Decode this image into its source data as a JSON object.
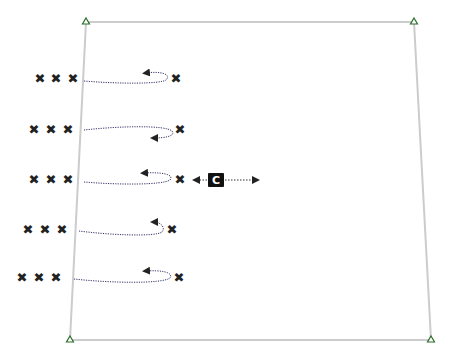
{
  "diagram": {
    "type": "drill-diagram",
    "background": "#ffffff",
    "field": {
      "border_color": "#cccccc",
      "corners": [
        {
          "name": "top-left",
          "x": 86,
          "y": 22
        },
        {
          "name": "top-right",
          "x": 414,
          "y": 22
        },
        {
          "name": "bottom-right",
          "x": 431,
          "y": 340
        },
        {
          "name": "bottom-left",
          "x": 70,
          "y": 340
        }
      ],
      "corner_marker": "cone-triangle",
      "corner_marker_color": "#2a6e2a"
    },
    "player_glyph": "✖",
    "player_color": "#222222",
    "path_color": "#333366",
    "rows": [
      {
        "queue": [
          {
            "x": 40,
            "y": 78
          },
          {
            "x": 56,
            "y": 78
          },
          {
            "x": 73,
            "y": 78
          }
        ],
        "player": {
          "x": 176,
          "y": 78
        },
        "path": "M84,81 C120,84 160,84 166,80 C172,74 160,71 146,73",
        "arrow_at": {
          "x": 143,
          "y": 73
        }
      },
      {
        "queue": [
          {
            "x": 34,
            "y": 129
          },
          {
            "x": 51,
            "y": 129
          },
          {
            "x": 68,
            "y": 129
          }
        ],
        "player": {
          "x": 180,
          "y": 129
        },
        "path": "M84,130 C120,126 165,125 172,131 C176,136 165,138 154,138",
        "arrow_at": {
          "x": 154,
          "y": 138
        }
      },
      {
        "queue": [
          {
            "x": 34,
            "y": 179
          },
          {
            "x": 51,
            "y": 179
          },
          {
            "x": 68,
            "y": 179
          }
        ],
        "player": {
          "x": 180,
          "y": 179
        },
        "path": "M84,182 C120,185 162,185 170,180 C175,174 160,172 144,173",
        "arrow_at": {
          "x": 141,
          "y": 173
        }
      },
      {
        "queue": [
          {
            "x": 28,
            "y": 229
          },
          {
            "x": 45,
            "y": 229
          },
          {
            "x": 62,
            "y": 229
          }
        ],
        "player": {
          "x": 172,
          "y": 229
        },
        "path": "M79,231 C110,235 155,237 162,232 C166,227 160,222 154,222",
        "arrow_at": {
          "x": 153,
          "y": 222
        }
      },
      {
        "queue": [
          {
            "x": 22,
            "y": 277
          },
          {
            "x": 39,
            "y": 277
          },
          {
            "x": 56,
            "y": 277
          }
        ],
        "player": {
          "x": 179,
          "y": 277
        },
        "path": "M74,279 C110,283 162,284 170,278 C174,272 160,270 146,271",
        "arrow_at": {
          "x": 143,
          "y": 271
        }
      }
    ],
    "coach": {
      "label": "C",
      "x": 216,
      "y": 180,
      "box_color": "#111111",
      "text_color": "#ffffff",
      "arrow_left_to": 196,
      "arrow_right_to": 256
    }
  }
}
